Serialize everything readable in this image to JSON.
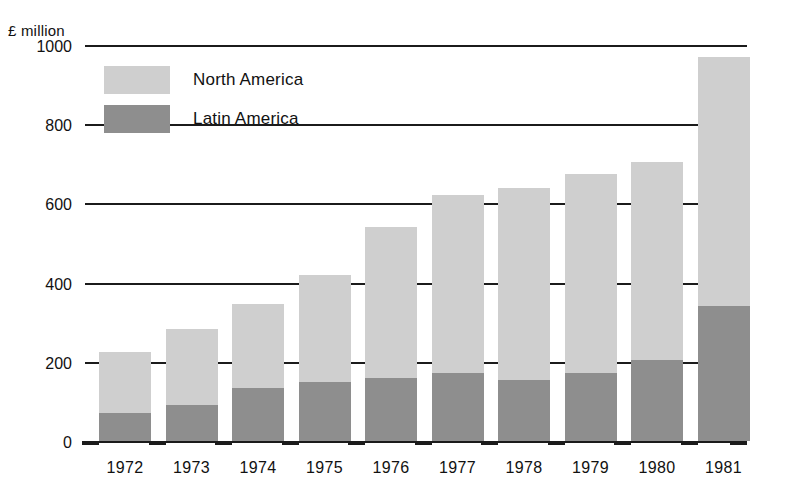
{
  "chart_data": {
    "type": "bar",
    "stacked": true,
    "title": "",
    "subtitle": "",
    "xlabel": "",
    "ylabel": "£ million",
    "unit_caption": "£ million",
    "grid": true,
    "legend_position": "inside-top-left",
    "categories": [
      "1972",
      "1973",
      "1974",
      "1975",
      "1976",
      "1977",
      "1978",
      "1979",
      "1980",
      "1981"
    ],
    "ylim": [
      0,
      1000
    ],
    "yticks": [
      0,
      200,
      400,
      600,
      800,
      1000
    ],
    "ytick_labels": [
      "0",
      "200",
      "400",
      "600",
      "800",
      "1000"
    ],
    "series": [
      {
        "name": "Latin America",
        "color": "#8e8e8e",
        "values": [
          70,
          90,
          135,
          148,
          160,
          172,
          155,
          172,
          205,
          340
        ]
      },
      {
        "name": "North America",
        "color": "#cfcfcf",
        "values": [
          155,
          193,
          210,
          272,
          380,
          448,
          485,
          503,
          500,
          630
        ]
      }
    ],
    "totals": [
      225,
      283,
      345,
      420,
      540,
      620,
      640,
      675,
      705,
      970
    ]
  },
  "legend": {
    "items": [
      {
        "label": "North America",
        "color": "#cfcfcf"
      },
      {
        "label": "Latin America",
        "color": "#8e8e8e"
      }
    ]
  },
  "colors": {
    "north_america": "#cfcfcf",
    "latin_america": "#8e8e8e",
    "axis": "#1b1b1b",
    "background": "#ffffff"
  }
}
